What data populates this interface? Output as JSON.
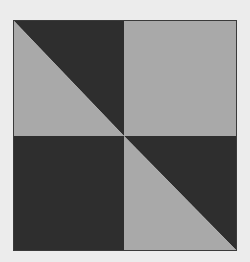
{
  "figure": {
    "colors": {
      "dark": "#2e2e2e",
      "light": "#a9a9a9",
      "border": "#3a3a3a",
      "background": "#ececec"
    },
    "quadrants": [
      {
        "position": "top-left",
        "fill": "split",
        "dark_half": "upper-right",
        "light_half": "lower-left"
      },
      {
        "position": "top-right",
        "fill": "light"
      },
      {
        "position": "bottom-left",
        "fill": "dark"
      },
      {
        "position": "bottom-right",
        "fill": "split",
        "dark_half": "upper-right",
        "light_half": "lower-left"
      }
    ]
  }
}
